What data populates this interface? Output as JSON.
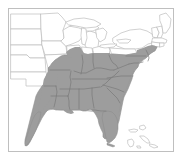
{
  "figure": {
    "type": "range-distribution-map",
    "title": "",
    "width": 182,
    "height": 158,
    "background_color": "#ffffff",
    "region_depicted": "Eastern and Central United States",
    "projection_note": "simple equirectangular-style outline map"
  },
  "frame": {
    "name": "map-border-frame",
    "stroke_color": "#bfbfbf",
    "stroke_width": 1,
    "x": 8.5,
    "y": 8.5,
    "width": 165,
    "height": 143,
    "fill": "none"
  },
  "colors": {
    "range_fill": "#9d9d9d",
    "range_fill_light": "#a8a8a8",
    "land_fill": "#ffffff",
    "state_border": "#bdbdbd",
    "state_border_shaded": "#777777",
    "coastline": "#999999",
    "frame": "#bfbfbf",
    "island_outline": "#b3b3b3"
  },
  "legend": {
    "present": false,
    "entries": []
  },
  "annotations": [],
  "labels": {
    "visible_text": [],
    "note": "No text labels, titles, axis ticks, or legend are rendered in this image."
  },
  "chart_data": {
    "type": "map",
    "title": "",
    "xlabel": "",
    "ylabel": "",
    "series": [
      {
        "name": "shaded-range",
        "color": "#9d9d9d",
        "description": "Contiguous shaded distribution area covering the southeastern United States, extending from eastern Texas and the Gulf Coast north through the lower Midwest and east to the mid-Atlantic seaboard, including all of Florida and the Florida Keys."
      },
      {
        "name": "unshaded-land",
        "color": "#ffffff",
        "description": "States and land area outside the distribution range, shown as white with light gray outlines."
      }
    ],
    "shaded_states_full": [
      "Florida",
      "Georgia",
      "South Carolina",
      "Alabama",
      "Mississippi",
      "Louisiana",
      "Tennessee",
      "Kentucky",
      "North Carolina",
      "Virginia",
      "West Virginia",
      "Arkansas",
      "Delaware",
      "Maryland"
    ],
    "shaded_states_partial": [
      "Texas",
      "Oklahoma",
      "Missouri",
      "Illinois",
      "Indiana",
      "Ohio",
      "Pennsylvania",
      "New Jersey",
      "New York"
    ],
    "unshaded_states": [
      "North Dakota",
      "South Dakota",
      "Nebraska",
      "Kansas",
      "Minnesota",
      "Iowa",
      "Wisconsin",
      "Michigan",
      "Maine",
      "New Hampshire",
      "Vermont",
      "Massachusetts",
      "Connecticut",
      "Rhode Island"
    ],
    "grid": false,
    "legend_position": "none"
  }
}
